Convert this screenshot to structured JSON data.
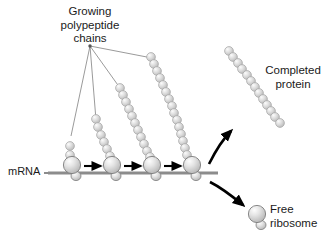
{
  "figure": {
    "title_hidden": "",
    "labels": {
      "growing_chains": "Growing\npolypeptide\nchains",
      "mrna": "mRNA",
      "completed_protein": "Completed\nprotein",
      "free_ribosome": "Free\nribosome"
    },
    "colors": {
      "background": "#ffffff",
      "bead_fill": "#d2d2d2",
      "bead_stroke": "#9a9a9a",
      "bead_highlight": "#f2f2f2",
      "ribosome_fill": "#d8d8d8",
      "ribosome_stroke": "#7d7d7d",
      "mrna_line": "#8c8c8c",
      "arrow_black": "#000000",
      "leader_line": "#808080",
      "text": "#1a1a1a"
    },
    "mrna_strand": {
      "name": "mRNA strand",
      "x1": 48,
      "x2": 218,
      "y": 173,
      "thickness": 3
    },
    "ribosomes": [
      {
        "id": "ribosome-1",
        "x": 72,
        "y": 166,
        "r": 9,
        "chain_beads": 2
      },
      {
        "id": "ribosome-2",
        "x": 112,
        "y": 166,
        "r": 9,
        "chain_beads": 6
      },
      {
        "id": "ribosome-3",
        "x": 152,
        "y": 166,
        "r": 9,
        "chain_beads": 11
      },
      {
        "id": "ribosome-4",
        "x": 192,
        "y": 166,
        "r": 9,
        "chain_beads": 16
      }
    ],
    "translation_arrows": [
      {
        "id": "arrow-1",
        "x1": 85,
        "x2": 101,
        "y": 166
      },
      {
        "id": "arrow-2",
        "x1": 125,
        "x2": 141,
        "y": 166
      },
      {
        "id": "arrow-3",
        "x1": 165,
        "x2": 181,
        "y": 166
      }
    ],
    "curved_arrows": [
      {
        "id": "arrow-to-completed-protein",
        "direction": "up-right"
      },
      {
        "id": "arrow-to-free-ribosome",
        "direction": "down-right"
      }
    ],
    "completed_protein": {
      "beads": 13,
      "x1": 228,
      "y1": 50,
      "x2": 281,
      "y2": 124
    },
    "free_ribosome": {
      "x": 257,
      "y": 215,
      "r": 9
    },
    "leader_lines": {
      "origin_x": 90,
      "origin_y": 46,
      "count": 4
    }
  }
}
